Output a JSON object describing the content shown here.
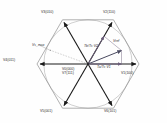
{
  "figure": {
    "type": "space-vector-modulation-hexagon",
    "colors": {
      "active_vector": "#1a1a1a",
      "hexagon_edge": "#8a8a8a",
      "circle": "#a8a8a8",
      "reference_vector": "#4a4a60",
      "component_vector": "#6b5d7a",
      "dashed_guide": "#9a9a9a",
      "text": "#2b2b2b",
      "background": "#fefefe"
    }
  },
  "vectors": {
    "v1": {
      "label": "V1(100)",
      "name": "V",
      "index": "1",
      "state": "(100)",
      "angle_deg": 0
    },
    "v2": {
      "label": "V2(110)",
      "name": "V",
      "index": "2",
      "state": "(110)",
      "angle_deg": 60
    },
    "v3": {
      "label": "V3(010)",
      "name": "V",
      "index": "3",
      "state": "(010)",
      "angle_deg": 120
    },
    "v4": {
      "label": "V4(011)",
      "name": "V",
      "index": "4",
      "state": "(011)",
      "angle_deg": 180
    },
    "v5": {
      "label": "V5(001)",
      "name": "V",
      "index": "5",
      "state": "(001)",
      "angle_deg": 240
    },
    "v6": {
      "label": "V6(101)",
      "name": "V",
      "index": "6",
      "state": "(101)",
      "angle_deg": 300
    },
    "v0": {
      "label": "V0(000)",
      "name": "V",
      "index": "0",
      "state": "(000)"
    },
    "v7": {
      "label": "V7(111)",
      "name": "V",
      "index": "7",
      "state": "(111)"
    }
  },
  "annotations": {
    "reference": {
      "label": "Vref",
      "name": "V",
      "sub": "ref"
    },
    "component_b": {
      "label": "Tb/Ts·V2",
      "numerator": "T",
      "num_sub": "b",
      "denominator": "T",
      "den_sub": "s",
      "vector": "V",
      "vec_sub": "2"
    },
    "component_a": {
      "label": "Ta/Ts·V1",
      "numerator": "T",
      "num_sub": "a",
      "denominator": "T",
      "den_sub": "s",
      "vector": "V",
      "vec_sub": "1"
    },
    "vs_max": {
      "label": "Vs_max",
      "name": "V",
      "sub": "s_max"
    }
  },
  "geometry": {
    "center": {
      "x": 88,
      "y": 64
    },
    "radius": 51,
    "circle_radius": 44,
    "hexagon_vertices_deg": [
      0,
      60,
      120,
      180,
      240,
      300
    ],
    "reference_angle_deg": 22,
    "reference_magnitude": 36
  }
}
